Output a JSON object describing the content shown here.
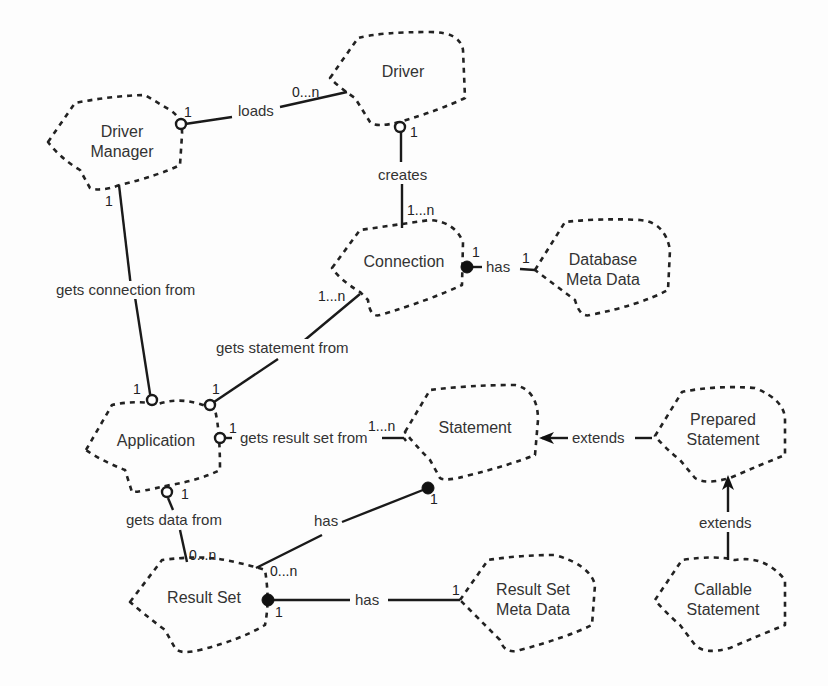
{
  "diagram": {
    "type": "uml-class-relationship",
    "nodes": {
      "driver_manager": {
        "line1": "Driver",
        "line2": "Manager"
      },
      "driver": {
        "line1": "Driver"
      },
      "connection": {
        "line1": "Connection"
      },
      "database_meta_data": {
        "line1": "Database",
        "line2": "Meta Data"
      },
      "application": {
        "line1": "Application"
      },
      "statement": {
        "line1": "Statement"
      },
      "prepared_statement": {
        "line1": "Prepared",
        "line2": "Statement"
      },
      "result_set": {
        "line1": "Result Set"
      },
      "result_set_meta_data": {
        "line1": "Result Set",
        "line2": "Meta Data"
      },
      "callable_statement": {
        "line1": "Callable",
        "line2": "Statement"
      }
    },
    "edges": [
      {
        "id": "loads",
        "from": "Driver Manager",
        "to": "Driver",
        "label": "loads",
        "from_mult": "1",
        "to_mult": "0...n"
      },
      {
        "id": "creates",
        "from": "Driver",
        "to": "Connection",
        "label": "creates",
        "from_mult": "1",
        "to_mult": "1...n"
      },
      {
        "id": "conn_has",
        "from": "Connection",
        "to": "Database Meta Data",
        "label": "has",
        "from_mult": "1",
        "to_mult": "1"
      },
      {
        "id": "gets_connection",
        "from": "Application",
        "to": "Driver Manager",
        "label": "gets connection from",
        "from_mult": "1",
        "to_mult": "1"
      },
      {
        "id": "gets_statement",
        "from": "Application",
        "to": "Connection",
        "label": "gets statement from",
        "from_mult": "1",
        "to_mult": "1...n"
      },
      {
        "id": "gets_result_set",
        "from": "Application",
        "to": "Statement",
        "label": "gets result set from",
        "from_mult": "1",
        "to_mult": "1...n"
      },
      {
        "id": "gets_data",
        "from": "Application",
        "to": "Result Set",
        "label": "gets data from",
        "from_mult": "1",
        "to_mult": "0...n"
      },
      {
        "id": "stmt_has",
        "from": "Statement",
        "to": "Result Set",
        "label": "has",
        "from_mult": "1",
        "to_mult": "0...n"
      },
      {
        "id": "rs_has",
        "from": "Result Set",
        "to": "Result Set Meta Data",
        "label": "has",
        "from_mult": "1",
        "to_mult": "1"
      },
      {
        "id": "extends_ps",
        "from": "Prepared Statement",
        "to": "Statement",
        "label": "extends"
      },
      {
        "id": "extends_cs",
        "from": "Callable Statement",
        "to": "Prepared Statement",
        "label": "extends"
      }
    ],
    "mult": {
      "one": "1",
      "zero_n": "0...n",
      "one_n": "1...n"
    },
    "colors": {
      "line": "#1a1a1a",
      "text": "#333333",
      "background": "#fdfdfd"
    }
  }
}
